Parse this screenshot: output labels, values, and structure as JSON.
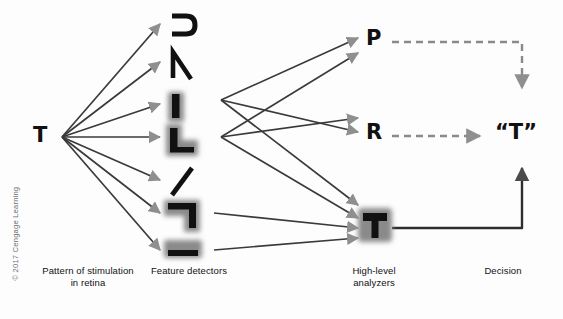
{
  "figure": {
    "background_color": "#fdfdfd",
    "arrow_line_color": "#3a3a3a",
    "arrow_head_color": "#8f8f8f",
    "shadow_color": "#8a8a8a",
    "glyph_color": "#111111"
  },
  "stimulus": {
    "label": "T",
    "caption_line1": "Pattern of stimulation",
    "caption_line2": "in retina"
  },
  "detectors": {
    "caption": "Feature detectors",
    "items": [
      {
        "name": "curve-detector",
        "icon": "curve-open-left",
        "shadowed": false
      },
      {
        "name": "angle-detector",
        "icon": "angle-vertex",
        "shadowed": false
      },
      {
        "name": "vertical-line-detector",
        "icon": "vertical-bar",
        "shadowed": true
      },
      {
        "name": "corner-detector-lower-left",
        "icon": "corner-gamma",
        "shadowed": true
      },
      {
        "name": "oblique-line-detector",
        "icon": "diagonal-stroke",
        "shadowed": false
      },
      {
        "name": "corner-detector-upper-right",
        "icon": "corner-reverse-gamma",
        "shadowed": true
      },
      {
        "name": "horizontal-line-detector",
        "icon": "horizontal-bar",
        "shadowed": true
      }
    ]
  },
  "analyzers": {
    "caption_line1": "High-level",
    "caption_line2": "analyzers",
    "items": [
      {
        "name": "analyzer-p",
        "label": "P",
        "type": "letter",
        "output": "dashed-rejected"
      },
      {
        "name": "analyzer-r",
        "label": "R",
        "type": "letter",
        "output": "dashed-rejected"
      },
      {
        "name": "analyzer-t",
        "label": "T",
        "type": "shadowed-letter",
        "output": "solid-selected"
      }
    ]
  },
  "decision": {
    "caption": "Decision",
    "label": "“T”"
  },
  "copyright": {
    "text": "© 2017 Cengage Learning"
  }
}
